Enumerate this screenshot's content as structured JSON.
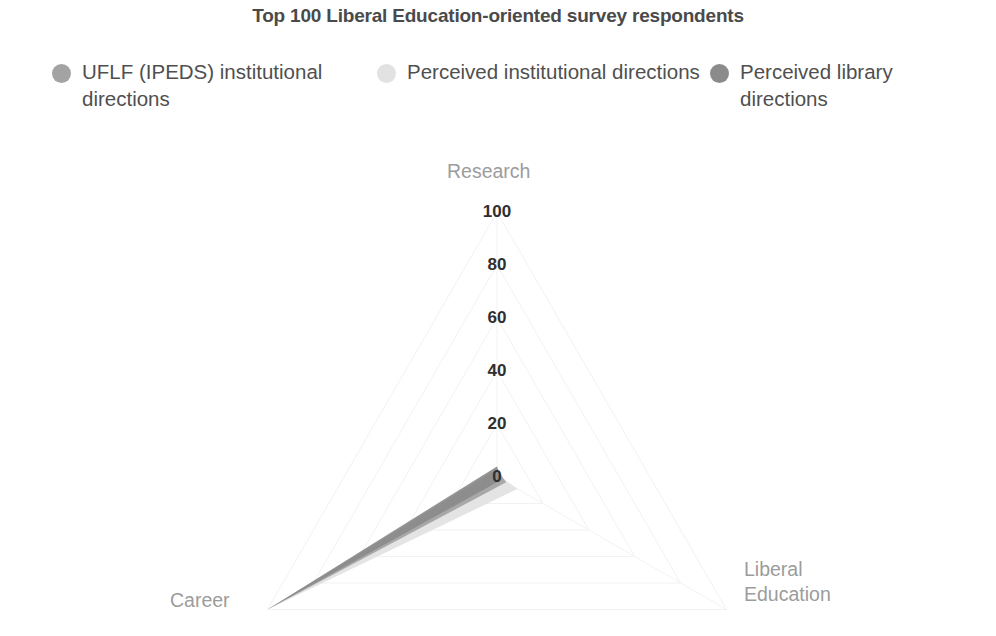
{
  "title": "Top 100 Liberal Education-oriented survey respondents",
  "legend": {
    "items": [
      {
        "label": "UFLF (IPEDS)\ninstitutional directions",
        "color": "#a3a3a3",
        "marker": "legend-dot-icon"
      },
      {
        "label": "Perceived institutional\ndirections",
        "color": "#e2e2e2",
        "marker": "legend-dot-icon"
      },
      {
        "label": "Perceived library\ndirections",
        "color": "#8b8b8b",
        "marker": "legend-dot-icon"
      }
    ]
  },
  "chart_data": {
    "type": "radar",
    "title": "Top 100 Liberal Education-oriented survey respondents",
    "categories": [
      "Research",
      "Career",
      "Liberal Education"
    ],
    "tick_labels": [
      "0",
      "20",
      "40",
      "60",
      "80",
      "100"
    ],
    "rlim": [
      0,
      100
    ],
    "rticks": [
      0,
      20,
      40,
      60,
      80,
      100
    ],
    "grid": true,
    "legend_position": "top",
    "series": [
      {
        "name": "UFLF (IPEDS) institutional directions",
        "color": "#a3a3a3",
        "values": [
          3,
          4,
          100
        ]
      },
      {
        "name": "Perceived institutional directions",
        "color": "#e2e2e2",
        "values": [
          1,
          9,
          100
        ]
      },
      {
        "name": "Perceived library directions",
        "color": "#8b8b8b",
        "values": [
          4,
          2,
          100
        ]
      }
    ]
  }
}
